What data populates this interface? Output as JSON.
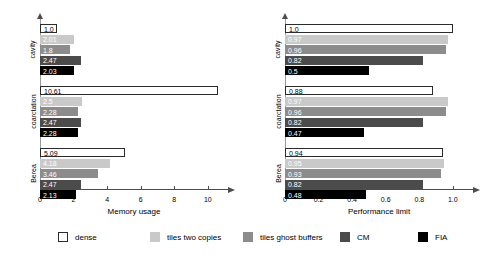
{
  "chart_data": [
    {
      "type": "bar",
      "orientation": "horizontal",
      "title": "",
      "xlabel": "Memory usage",
      "ylabel": "",
      "xlim": [
        0,
        11.2
      ],
      "xticks": [
        "0",
        "2",
        "4",
        "6",
        "8",
        "10"
      ],
      "xtick_values": [
        0,
        2,
        4,
        6,
        8,
        10
      ],
      "grid": false,
      "categories": [
        "cavity",
        "coarctation",
        "Berea"
      ],
      "series": [
        {
          "name": "dense",
          "values": [
            1.0,
            10.61,
            5.09
          ],
          "labels": [
            "1.0",
            "10.61",
            "5.09"
          ],
          "color": "#ffffff"
        },
        {
          "name": "tiles two copies",
          "values": [
            2.01,
            2.5,
            4.18
          ],
          "labels": [
            "2.01",
            "2.5",
            "4.18"
          ],
          "color": "#c9c9c9"
        },
        {
          "name": "tiles ghost buffers",
          "values": [
            1.8,
            2.28,
            3.46
          ],
          "labels": [
            "1.8",
            "2.28",
            "3.46"
          ],
          "color": "#8c8c8c"
        },
        {
          "name": "CM",
          "values": [
            2.47,
            2.47,
            2.47
          ],
          "labels": [
            "2.47",
            "2.47",
            "2.47"
          ],
          "color": "#4b4b4b"
        },
        {
          "name": "FIA",
          "values": [
            2.03,
            2.28,
            2.13
          ],
          "labels": [
            "2.03",
            "2.28",
            "2.13"
          ],
          "color": "#000000"
        }
      ]
    },
    {
      "type": "bar",
      "orientation": "horizontal",
      "title": "",
      "xlabel": "Performance limit",
      "ylabel": "",
      "xlim": [
        0,
        1.12
      ],
      "xticks": [
        "0",
        "0.2",
        "0.4",
        "0.6",
        "0.8",
        "1.0"
      ],
      "xtick_values": [
        0,
        0.2,
        0.4,
        0.6,
        0.8,
        1.0
      ],
      "grid": false,
      "categories": [
        "cavity",
        "coarctation",
        "Berea"
      ],
      "series": [
        {
          "name": "dense",
          "values": [
            1.0,
            0.88,
            0.94
          ],
          "labels": [
            "1.0",
            "0.88",
            "0.94"
          ],
          "color": "#ffffff"
        },
        {
          "name": "tiles two copies",
          "values": [
            0.97,
            0.97,
            0.95
          ],
          "labels": [
            "0.97",
            "0.97",
            "0.95"
          ],
          "color": "#c9c9c9"
        },
        {
          "name": "tiles ghost buffers",
          "values": [
            0.96,
            0.96,
            0.93
          ],
          "labels": [
            "0.96",
            "0.96",
            "0.93"
          ],
          "color": "#8c8c8c"
        },
        {
          "name": "CM",
          "values": [
            0.82,
            0.82,
            0.82
          ],
          "labels": [
            "0.82",
            "0.82",
            "0.82"
          ],
          "color": "#4b4b4b"
        },
        {
          "name": "FIA",
          "values": [
            0.5,
            0.47,
            0.48
          ],
          "labels": [
            "0.5",
            "0.47",
            "0.48"
          ],
          "color": "#000000"
        }
      ]
    }
  ],
  "legend": {
    "position": "bottom",
    "items": [
      {
        "label": "dense",
        "color": "#ffffff"
      },
      {
        "label": "tiles two copies",
        "color": "#c9c9c9"
      },
      {
        "label": "tiles ghost buffers",
        "color": "#8c8c8c"
      },
      {
        "label": "CM",
        "color": "#4b4b4b"
      },
      {
        "label": "FIA",
        "color": "#000000"
      }
    ]
  }
}
